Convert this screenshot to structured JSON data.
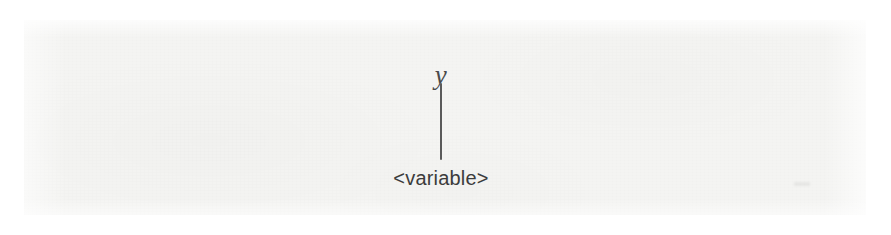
{
  "figure": {
    "kind": "parse-tree-fragment",
    "medium": "scanned-book-page",
    "background_color": "#f4f4f2",
    "page_margin_color": "#ffffff",
    "ink_color": "#3c3c3c",
    "edge_color": "#5a5a5a"
  },
  "tree": {
    "terminal": {
      "text": "y",
      "style": "italic-serif",
      "color": "#4a4a4a"
    },
    "edge": {
      "name": "vertical-connector",
      "orientation": "vertical",
      "color": "#5a5a5a"
    },
    "nonterminal": {
      "text": "<variable>",
      "style": "sans-serif",
      "color": "#3c3c3c"
    }
  }
}
